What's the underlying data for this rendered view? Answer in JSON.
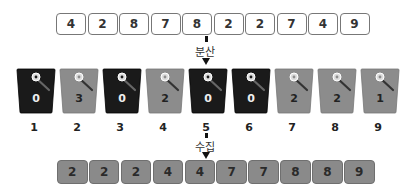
{
  "diagram": {
    "input_array": [
      "4",
      "2",
      "8",
      "7",
      "8",
      "2",
      "2",
      "7",
      "4",
      "9"
    ],
    "scatter_label": "분산",
    "buckets": [
      {
        "index": "1",
        "count": "0",
        "style": "dark"
      },
      {
        "index": "2",
        "count": "3",
        "style": "light"
      },
      {
        "index": "3",
        "count": "0",
        "style": "dark"
      },
      {
        "index": "4",
        "count": "2",
        "style": "light"
      },
      {
        "index": "5",
        "count": "0",
        "style": "dark"
      },
      {
        "index": "6",
        "count": "0",
        "style": "dark"
      },
      {
        "index": "7",
        "count": "2",
        "style": "light"
      },
      {
        "index": "8",
        "count": "2",
        "style": "light"
      },
      {
        "index": "9",
        "count": "1",
        "style": "light"
      }
    ],
    "gather_label": "수집",
    "output_array": [
      "2",
      "2",
      "2",
      "4",
      "4",
      "7",
      "7",
      "8",
      "8",
      "9"
    ],
    "colors": {
      "dark_bucket": "#1a1a1a",
      "light_bucket": "#8c8c8c",
      "output_cell": "#8a8a8a",
      "input_cell": "#ffffff"
    }
  }
}
